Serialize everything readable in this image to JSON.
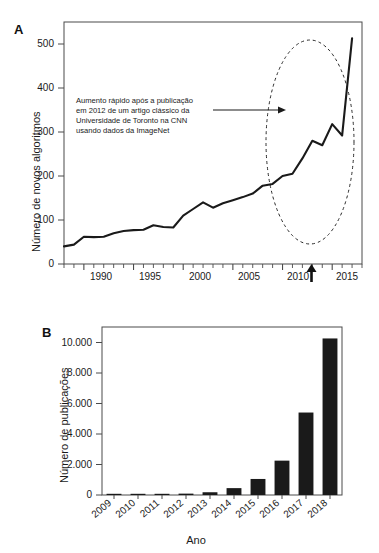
{
  "figure": {
    "panel_a_label": "A",
    "panel_b_label": "B"
  },
  "chart_data": [
    {
      "id": "panel-a",
      "type": "line",
      "title": "",
      "xlabel": "",
      "ylabel": "Número de novos algoritmos",
      "xlim": [
        1988,
        2018
      ],
      "ylim": [
        0,
        550
      ],
      "ytick_labels": [
        "0",
        "100",
        "200",
        "300",
        "400",
        "500"
      ],
      "yticks": [
        0,
        100,
        200,
        300,
        400,
        500
      ],
      "xtick_labels": [
        "1990",
        "1995",
        "2000",
        "2005",
        "2010",
        "2015"
      ],
      "xticks": [
        1990,
        1995,
        2000,
        2005,
        2010,
        2015
      ],
      "minor_xtick_interval": 1,
      "grid": false,
      "legend": "none",
      "x": [
        1988,
        1989,
        1990,
        1991,
        1992,
        1993,
        1994,
        1995,
        1996,
        1997,
        1998,
        1999,
        2000,
        2001,
        2002,
        2003,
        2004,
        2005,
        2006,
        2007,
        2008,
        2009,
        2010,
        2011,
        2012,
        2013,
        2014,
        2015,
        2016,
        2017
      ],
      "values": [
        40,
        44,
        62,
        61,
        62,
        70,
        75,
        77,
        78,
        88,
        84,
        83,
        110,
        125,
        140,
        128,
        138,
        145,
        152,
        160,
        178,
        182,
        200,
        205,
        240,
        280,
        270,
        318,
        292,
        513
      ],
      "annotation": {
        "lines": [
          "Aumento rápido após a publicação",
          "em 2012 de um artigo clássico da",
          "Universidade de Toronto na CNN",
          "usando dados da ImageNet"
        ],
        "arrow": "arrow-right",
        "highlight_shape": "dashed-ellipse",
        "axis_marker": "up-arrow-2012",
        "axis_marker_year": 2012
      }
    },
    {
      "id": "panel-b",
      "type": "bar",
      "title": "",
      "xlabel": "Ano",
      "ylabel": "Número de publicações",
      "categories": [
        "2009",
        "2010",
        "2011",
        "2012",
        "2013",
        "2014",
        "2015",
        "2016",
        "2017",
        "2018"
      ],
      "values": [
        20,
        40,
        60,
        90,
        180,
        450,
        1050,
        2250,
        5400,
        10250
      ],
      "ylim": [
        0,
        11000
      ],
      "yticks": [
        0,
        2000,
        4000,
        6000,
        8000,
        10000
      ],
      "ytick_labels": [
        "0",
        "2.000",
        "4.000",
        "6.000",
        "8.000",
        "10.000"
      ],
      "grid": false,
      "legend": "none",
      "bar_color": "#1a1a1a"
    }
  ]
}
